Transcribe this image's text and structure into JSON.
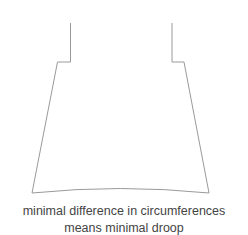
{
  "diagram": {
    "shape": "garment-hem-outline",
    "stroke_color": "#999999",
    "caption_lines": [
      "minimal difference in circumferences",
      "means minimal droop"
    ]
  }
}
